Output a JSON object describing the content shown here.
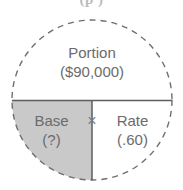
{
  "figure": {
    "type": "percent-circle-diagram",
    "clipped_caption": "(p        )",
    "colors": {
      "shaded_fill": "#c9c9c9",
      "unshaded_fill": "#ffffff",
      "outline": "#6e6e6e",
      "divider": "#5d5d5d",
      "text": "#6b6b6b",
      "background": "#ffffff"
    },
    "circle": {
      "center_x": 92,
      "center_y": 100,
      "radius": 80,
      "border_style": "dashed"
    }
  },
  "sections": {
    "top": {
      "name": "Portion",
      "label": "Portion",
      "value": "($90,000)",
      "shaded": false
    },
    "bottom_left": {
      "name": "Base",
      "label": "Base",
      "value": "(?)",
      "shaded": true
    },
    "bottom_right": {
      "name": "Rate",
      "label": "Rate",
      "value": "(.60)",
      "shaded": false
    }
  },
  "operator": {
    "symbol": "×",
    "meaning": "multiply"
  }
}
